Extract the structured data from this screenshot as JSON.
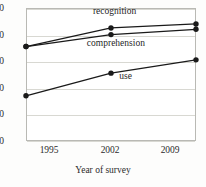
{
  "chart_data": {
    "type": "line",
    "title": "",
    "subtitle": "",
    "xlabel": "Year of survey",
    "ylabel": "",
    "categories": [
      "1995",
      "2002",
      "2009"
    ],
    "x": [
      1995,
      2002,
      2009
    ],
    "xlim": [
      1995,
      2009
    ],
    "ylim": [
      0,
      100
    ],
    "y_ticks": [
      0,
      20,
      40,
      60,
      80,
      100
    ],
    "x_ticks": [
      1995,
      2002,
      2009
    ],
    "grid": "horizontal",
    "legend_position": "inline-annotations",
    "marker": "filled-circle",
    "line_color": "#1a1a1a",
    "marker_color": "#1a1a1a",
    "grid_color": "#d8d8d2",
    "frame_color": "#b9b9b4",
    "background_color": "#ffffff",
    "series": [
      {
        "name": "recognition",
        "label": "recognition",
        "values": [
          71,
          85,
          88
        ],
        "label_x": 2002.3,
        "label_y": 97
      },
      {
        "name": "comprehension",
        "label": "comprehension",
        "values": [
          71,
          80,
          84
        ],
        "label_x": 2002.4,
        "label_y": 73
      },
      {
        "name": "use",
        "label": "use",
        "values": [
          34,
          51,
          61
        ],
        "label_x": 2003.2,
        "label_y": 48
      }
    ]
  },
  "axis": {
    "y_tick_labels": [
      "100",
      "80",
      "60",
      "40",
      "20",
      "0"
    ],
    "x_tick_labels": [
      "1995",
      "2002",
      "2009"
    ],
    "x_title": "Year of survey"
  }
}
